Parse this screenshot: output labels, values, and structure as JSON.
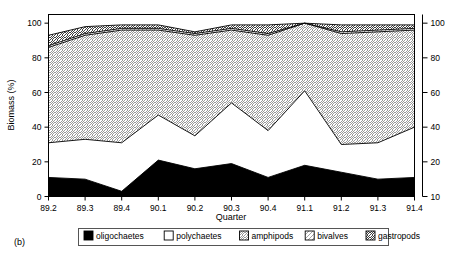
{
  "figure": {
    "panel_label": "(b)",
    "background": "#ffffff",
    "line_color": "#000000"
  },
  "chart_data": {
    "type": "area",
    "title": "",
    "subtitle": "",
    "xlabel": "Quarter",
    "ylabel": "Biomass (%)",
    "categories": [
      "89.2",
      "89.3",
      "89.4",
      "90.1",
      "90.2",
      "90.3",
      "90.4",
      "91.1",
      "91.2",
      "91.3",
      "91.4"
    ],
    "x": [
      89.2,
      89.3,
      89.4,
      90.1,
      90.2,
      90.3,
      90.4,
      91.1,
      91.2,
      91.3,
      91.4
    ],
    "stacked": true,
    "grid": false,
    "legend_position": "bottom",
    "left_axis": {
      "label": "Biomass (%)",
      "ticks": [
        "0",
        "20",
        "40",
        "60",
        "80",
        "100"
      ],
      "tick_values": [
        0,
        20,
        40,
        60,
        80,
        100
      ],
      "ylim": [
        0,
        105
      ]
    },
    "right_axis": {
      "label": "",
      "ticks": [
        "10",
        "20",
        "40",
        "60",
        "80",
        "100"
      ],
      "tick_values": [
        0,
        20,
        40,
        60,
        80,
        100
      ],
      "ylim": [
        0,
        105
      ]
    },
    "series": [
      {
        "name": "oligochaetes",
        "fill": "solid-black",
        "color": "#000000",
        "values": [
          11,
          10,
          3,
          21,
          16,
          19,
          11,
          18,
          14,
          10,
          11
        ],
        "cumulative": [
          11,
          10,
          3,
          21,
          16,
          19,
          11,
          18,
          14,
          10,
          11
        ]
      },
      {
        "name": "polychaetes",
        "fill": "solid-white",
        "color": "#ffffff",
        "values": [
          20,
          23,
          28,
          26,
          19,
          35,
          27,
          43,
          16,
          21,
          29
        ],
        "cumulative": [
          31,
          33,
          31,
          47,
          35,
          54,
          38,
          61,
          30,
          31,
          40
        ]
      },
      {
        "name": "amphipods",
        "fill": "crosshatch",
        "color": "#5a5a5a",
        "values": [
          55,
          60,
          65,
          49,
          58,
          42,
          55,
          39,
          64,
          64,
          56
        ],
        "cumulative": [
          86,
          93,
          96,
          96,
          93,
          96,
          93,
          100,
          94,
          95,
          96
        ]
      },
      {
        "name": "bivalves",
        "fill": "fine-diagonal",
        "color": "#777777",
        "values": [
          1,
          1,
          1,
          1,
          1,
          1,
          1,
          0,
          1,
          1,
          1
        ],
        "cumulative": [
          87,
          94,
          97,
          97,
          94,
          97,
          94,
          100,
          95,
          96,
          97
        ]
      },
      {
        "name": "gastropods",
        "fill": "wide-diagonal",
        "color": "#000000",
        "values": [
          6,
          4,
          2,
          2,
          1,
          2,
          5,
          0,
          4,
          3,
          2
        ],
        "cumulative": [
          93,
          98,
          99,
          99,
          95,
          99,
          99,
          100,
          99,
          99,
          99
        ]
      }
    ]
  },
  "legend": {
    "items": [
      {
        "label": "oligochaetes",
        "swatch": "solid-black"
      },
      {
        "label": "polychaetes",
        "swatch": "solid-white"
      },
      {
        "label": "amphipods",
        "swatch": "crosshatch"
      },
      {
        "label": "bivalves",
        "swatch": "fine-diagonal"
      },
      {
        "label": "gastropods",
        "swatch": "wide-diagonal"
      }
    ]
  }
}
